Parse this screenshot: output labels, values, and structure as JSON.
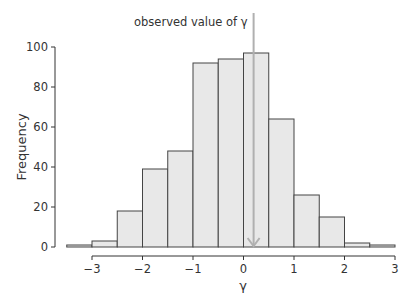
{
  "chart_data": {
    "type": "bar",
    "subtype": "histogram",
    "title": "",
    "xlabel": "γ",
    "ylabel": "Frequency",
    "bin_width": 0.5,
    "bin_edges": [
      -3.5,
      -3.0,
      -2.5,
      -2.0,
      -1.5,
      -1.0,
      -0.5,
      0.0,
      0.5,
      1.0,
      1.5,
      2.0,
      2.5,
      3.0
    ],
    "categories": [
      "-3.5 to -3.0",
      "-3.0 to -2.5",
      "-2.5 to -2.0",
      "-2.0 to -1.5",
      "-1.5 to -1.0",
      "-1.0 to -0.5",
      "-0.5 to 0.0",
      "0.0 to 0.5",
      "0.5 to 1.0",
      "1.0 to 1.5",
      "1.5 to 2.0",
      "2.0 to 2.5",
      "2.5 to 3.0"
    ],
    "values": [
      1,
      3,
      18,
      39,
      48,
      92,
      94,
      97,
      64,
      26,
      15,
      2,
      1
    ],
    "xlim": [
      -3.5,
      3.0
    ],
    "ylim": [
      0,
      100
    ],
    "x_ticks": [
      -3,
      -2,
      -1,
      0,
      1,
      2,
      3
    ],
    "x_tick_labels": [
      "−3",
      "−2",
      "−1",
      "0",
      "1",
      "2",
      "3"
    ],
    "y_ticks": [
      0,
      20,
      40,
      60,
      80,
      100
    ],
    "y_tick_labels": [
      "0",
      "20",
      "40",
      "60",
      "80",
      "100"
    ],
    "grid": false,
    "legend": null,
    "annotations": [
      {
        "text": "observed value of γ",
        "x": 0.2,
        "type": "vertical-arrow-line"
      }
    ],
    "colors": {
      "bar_fill": "#e8e8e8",
      "bar_edge": "#444444",
      "annotation_line": "#b0b0b0",
      "axis": "#333333"
    }
  }
}
